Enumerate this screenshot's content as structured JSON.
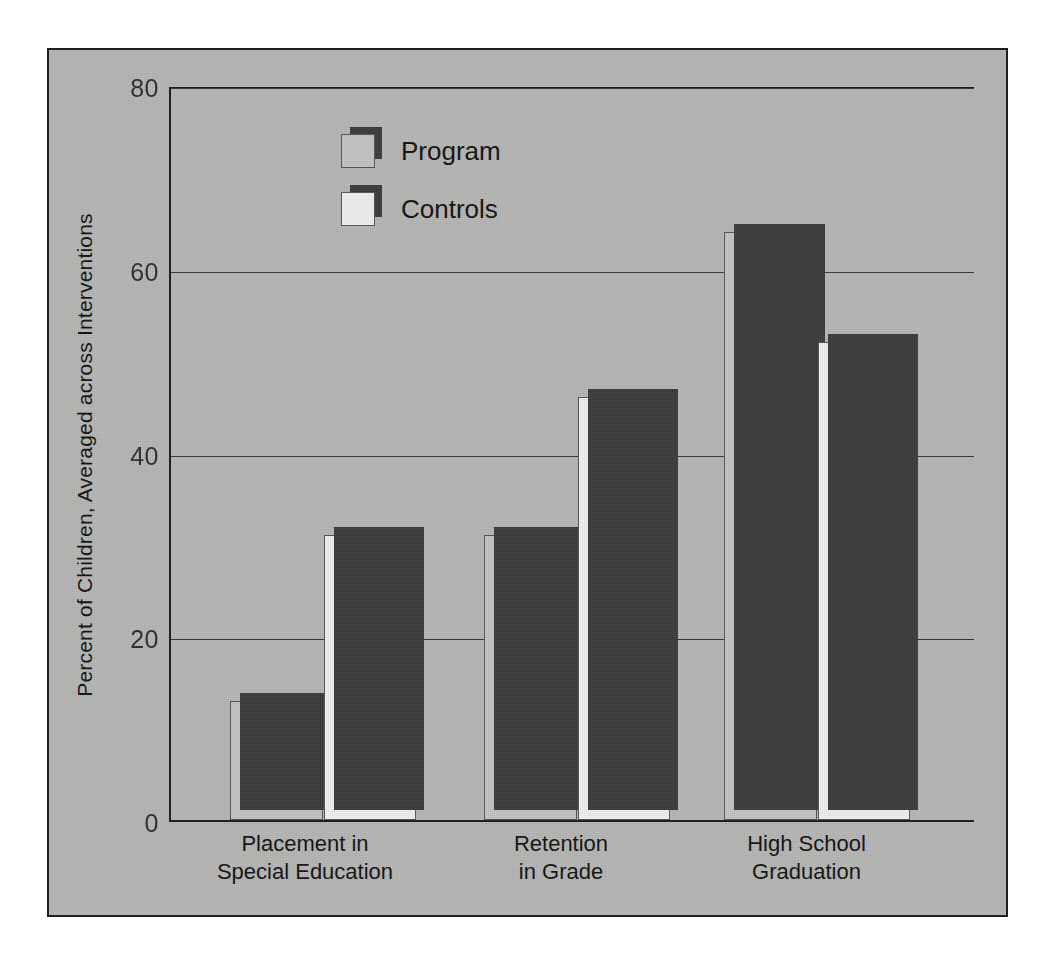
{
  "chart_data": {
    "type": "bar",
    "title": "",
    "xlabel": "",
    "ylabel": "Percent of Children, Averaged across Interventions",
    "categories": [
      "Placement in\nSpecial Education",
      "Retention\nin Grade",
      "High School\nGraduation"
    ],
    "series": [
      {
        "name": "Program",
        "values": [
          13,
          31,
          64
        ]
      },
      {
        "name": "Controls",
        "values": [
          31,
          46,
          52
        ]
      }
    ],
    "ylim": [
      0,
      80
    ],
    "yticks": [
      0,
      20,
      40,
      60,
      80
    ],
    "ytick_labels": [
      "0",
      "20",
      "40",
      "60",
      "80"
    ],
    "grid": true,
    "legend_position": "upper-center",
    "colors": {
      "program_fill": "#c3c3c1",
      "controls_fill": "#f0f0ee",
      "bar_shadow": "#3a3a3a",
      "background": "#b6b6b4",
      "axis": "#1a1a1a",
      "text": "#111111"
    }
  },
  "legend": {
    "items": [
      {
        "label": "Program"
      },
      {
        "label": "Controls"
      }
    ]
  }
}
